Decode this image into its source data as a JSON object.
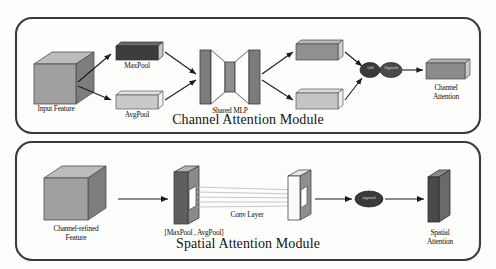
{
  "figure": {
    "type": "diagram",
    "background_color": "#fdfdfb",
    "border_color": "#3a3a3a",
    "arrow_color": "#1c1c1c"
  },
  "channel_module": {
    "title": "Channel Attention Module",
    "input": {
      "label": "Input Feature",
      "shape": "cube-3d",
      "color_front": "#9a9a9a",
      "color_top": "#b9b9b9",
      "color_side": "#7e7e7e"
    },
    "branches": [
      {
        "label": "MaxPool",
        "shape": "bar-3d",
        "color": "#3d3d3d",
        "position": "top"
      },
      {
        "label": "AvgPool",
        "shape": "bar-3d",
        "color": "#c9c9c9",
        "position": "bottom"
      }
    ],
    "mlp": {
      "label": "Shared MLP",
      "shape": "bottleneck",
      "color_outer": "#7c7c7c",
      "color_inner": "#8f8f8f"
    },
    "outputs": [
      {
        "shape": "bar-3d",
        "color": "#909090",
        "position": "top"
      },
      {
        "shape": "bar-3d",
        "color": "#c4c4c4",
        "position": "bottom"
      }
    ],
    "operations": [
      {
        "label": "Add",
        "shape": "ellipse",
        "color": "#3a3a3a"
      },
      {
        "label": "Sigmoid",
        "shape": "ellipse",
        "color": "#4a4a4a"
      }
    ],
    "output": {
      "label_line1": "Channel",
      "label_line2": "Attention",
      "shape": "bar-3d",
      "color": "#8b8b8b"
    }
  },
  "spatial_module": {
    "title": "Spatial Attention Module",
    "input": {
      "label_line1": "Channel-refined",
      "label_line2": "Feature",
      "shape": "cube-3d",
      "color_front": "#9a9a9a",
      "color_top": "#b9b9b9",
      "color_side": "#7e7e7e"
    },
    "pool_concat": {
      "label": "[MaxPool , AvgPool]",
      "shape": "slab-3d",
      "color_front": "#8d8d8d",
      "color_side": "#5a5a5a",
      "window_color": "#ffffff"
    },
    "conv": {
      "label": "Conv Layer",
      "connection_lines": 5,
      "line_color": "#b0b0b0"
    },
    "conv_output": {
      "shape": "slab-3d",
      "color_front": "#ffffff",
      "color_side": "#6e6e6e",
      "window_color": "#ffffff"
    },
    "operations": [
      {
        "label": "sigmoid",
        "shape": "ellipse",
        "color": "#3a3a3a"
      }
    ],
    "output": {
      "label_line1": "Spatial",
      "label_line2": "Attention",
      "shape": "slab-3d",
      "color_front": "#4a4a4a",
      "color_side": "#6a6a6a",
      "color_top": "#888888"
    }
  }
}
